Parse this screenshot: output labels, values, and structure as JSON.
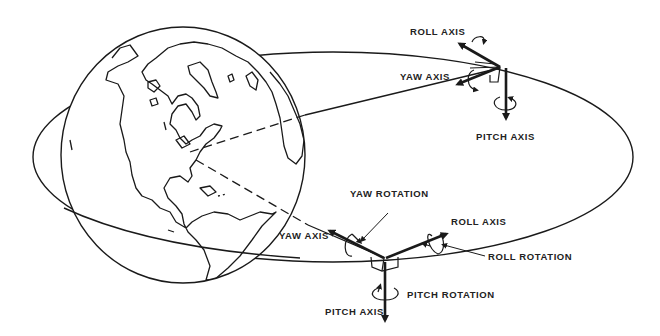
{
  "diagram": {
    "title": "",
    "colors": {
      "ink": "#1a1a1a",
      "background": "#ffffff"
    },
    "earth": {
      "label": "",
      "center": [
        183,
        155
      ],
      "rx": 122,
      "ry": 128
    },
    "orbit": {
      "center": [
        333,
        157
      ],
      "rx": 300,
      "ry": 105
    },
    "satellite_top": {
      "labels": {
        "roll_axis": "ROLL AXIS",
        "yaw_axis": "YAW AXIS",
        "pitch_axis": "PITCH AXIS"
      }
    },
    "satellite_bottom": {
      "labels": {
        "yaw_rotation": "YAW ROTATION",
        "roll_axis": "ROLL AXIS",
        "roll_rotation": "ROLL ROTATION",
        "yaw_axis": "YAW AXIS",
        "pitch_rotation": "PITCH ROTATION",
        "pitch_axis": "PITCH AXIS"
      }
    }
  }
}
